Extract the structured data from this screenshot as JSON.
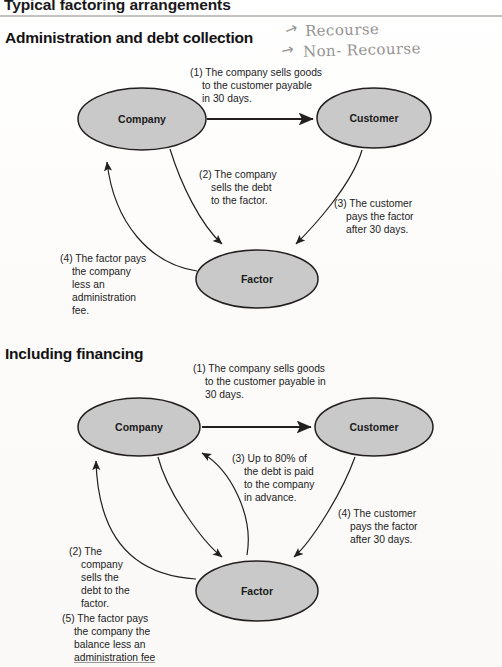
{
  "document": {
    "title": "Typical factoring arrangements"
  },
  "annotations": {
    "arrow_glyph": "→",
    "items": [
      {
        "name": "recourse",
        "text": "Recourse"
      },
      {
        "name": "non-recourse",
        "text": "Non- Recourse"
      }
    ]
  },
  "sections": [
    {
      "id": "admin",
      "heading": "Administration and debt collection",
      "nodes": {
        "company": "Company",
        "customer": "Customer",
        "factor": "Factor"
      },
      "captions": [
        {
          "id": "step-1",
          "lines": [
            "(1) The company sells goods",
            "to the customer payable",
            "in 30 days."
          ]
        },
        {
          "id": "step-2",
          "lines": [
            "(2) The company",
            "sells the debt",
            "to the factor."
          ]
        },
        {
          "id": "step-3",
          "lines": [
            "(3) The customer",
            "pays the factor",
            "after 30 days."
          ]
        },
        {
          "id": "step-4",
          "lines": [
            "(4) The factor pays",
            "the company",
            "less an",
            "administration",
            "fee."
          ]
        }
      ]
    },
    {
      "id": "financing",
      "heading": "Including financing",
      "nodes": {
        "company": "Company",
        "customer": "Customer",
        "factor": "Factor"
      },
      "captions": [
        {
          "id": "step-1",
          "lines": [
            "(1) The company sells goods",
            "to the customer payable in",
            "30 days."
          ]
        },
        {
          "id": "step-2",
          "lines": [
            "(2) The",
            "company",
            "sells the",
            "debt to the",
            "factor."
          ]
        },
        {
          "id": "step-3",
          "lines": [
            "(3) Up to 80% of",
            "the debt is paid",
            "to the company",
            "in advance."
          ]
        },
        {
          "id": "step-4",
          "lines": [
            "(4) The customer",
            "pays the factor",
            "after 30 days."
          ]
        },
        {
          "id": "step-5",
          "lines": [
            "(5) The factor pays",
            "the company the",
            "balance less an",
            "administration fee"
          ]
        }
      ]
    }
  ],
  "colors": {
    "node_fill": "#c9c9c9",
    "node_stroke": "#231f20",
    "rule": "#b9b7b4",
    "text": "#1d1c1e",
    "handwriting": "#8d8b88"
  }
}
